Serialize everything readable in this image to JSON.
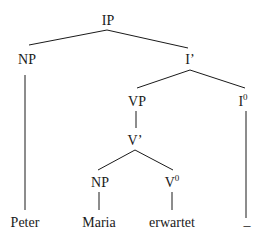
{
  "diagram": {
    "type": "syntax-tree",
    "nodes": {
      "ip": {
        "label": "IP"
      },
      "np_subject": {
        "label": "NP"
      },
      "i_bar": {
        "label": "I’"
      },
      "vp": {
        "label": "VP"
      },
      "i_head": {
        "label": "I",
        "superscript": "0"
      },
      "v_bar": {
        "label": "V’"
      },
      "np_object": {
        "label": "NP"
      },
      "v_head": {
        "label": "V",
        "superscript": "0"
      }
    },
    "leaves": {
      "peter": "Peter",
      "maria": "Maria",
      "erwartet": "erwartet",
      "empty": "_"
    },
    "edges": [
      [
        "IP",
        "NP"
      ],
      [
        "IP",
        "I’"
      ],
      [
        "NP",
        "Peter"
      ],
      [
        "I’",
        "VP"
      ],
      [
        "I’",
        "I0"
      ],
      [
        "VP",
        "V’"
      ],
      [
        "V’",
        "NP"
      ],
      [
        "V’",
        "V0"
      ],
      [
        "NP",
        "Maria"
      ],
      [
        "V0",
        "erwartet"
      ],
      [
        "I0",
        "_"
      ]
    ]
  }
}
